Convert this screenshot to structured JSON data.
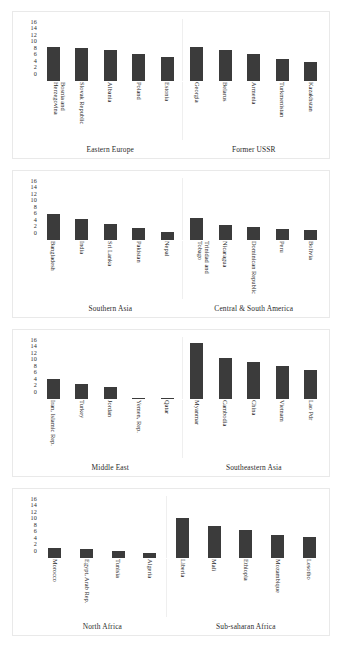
{
  "chart_data": {
    "type": "bar",
    "title": "",
    "xlabel": "",
    "ylabel": "",
    "ylim": [
      0,
      16
    ],
    "yticks": [
      "16",
      "14",
      "12",
      "10",
      "8",
      "6",
      "4",
      "2",
      "0"
    ],
    "grid": false,
    "legend": "none",
    "bar_color": "#3b3b3b",
    "panels": [
      {
        "groups": [
          {
            "caption": "Eastern Europe",
            "categories": [
              "Bosnia and Herzegovina",
              "Slovak Republic",
              "Albania",
              "Poland",
              "Estonia"
            ],
            "values": [
              8.7,
              8.4,
              7.9,
              7.0,
              6.3
            ]
          },
          {
            "caption": "Former USSR",
            "categories": [
              "Georgia",
              "Belarus",
              "Armenia",
              "Turkmenistan",
              "Kazakhstan"
            ],
            "values": [
              8.8,
              7.9,
              7.0,
              5.6,
              5.0
            ]
          }
        ]
      },
      {
        "groups": [
          {
            "caption": "Southern Asia",
            "categories": [
              "Bangladesh",
              "India",
              "Sri Lanka",
              "Pakistan",
              "Nepal"
            ],
            "values": [
              6.8,
              5.5,
              4.2,
              3.2,
              2.1
            ]
          },
          {
            "caption": "Central & South America",
            "categories": [
              "Trinidad and Tobago",
              "Nicaragua",
              "Dominican Republic",
              "Peru",
              "Bolivia"
            ],
            "values": [
              5.7,
              3.9,
              3.4,
              2.9,
              2.6
            ]
          }
        ]
      },
      {
        "groups": [
          {
            "caption": "Middle East",
            "categories": [
              "Iran, Islamic Rep.",
              "Turkey",
              "Jordan",
              "Yemen, Rep.",
              "Qatar"
            ],
            "values": [
              5.2,
              4.0,
              3.0,
              0.3,
              0.2
            ]
          },
          {
            "caption": "Southeastern Asia",
            "categories": [
              "Myanmar",
              "Cambodia",
              "China",
              "Vietnam",
              "Lao Pdr"
            ],
            "values": [
              14.4,
              10.7,
              9.6,
              8.6,
              7.5
            ]
          }
        ]
      },
      {
        "groups": [
          {
            "caption": "North Africa",
            "categories": [
              "Morocco",
              "Egypt, Arab Rep.",
              "Tunisia",
              "Algeria"
            ],
            "values": [
              2.6,
              2.4,
              1.7,
              1.3
            ]
          },
          {
            "caption": "Sub-saharan Africa",
            "categories": [
              "Liberia",
              "Mali",
              "Ethiopia",
              "Mozambique",
              "Lesotho"
            ],
            "values": [
              10.3,
              8.2,
              7.2,
              5.9,
              5.5
            ]
          }
        ]
      }
    ]
  }
}
